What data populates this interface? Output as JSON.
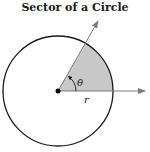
{
  "title": "Sector of a Circle",
  "diagram": {
    "angle_label": "θ",
    "radius_label": "r",
    "colors": {
      "sector_fill": "#c8c8c8",
      "circle_stroke": "#1a1a1a",
      "ray_stroke": "#7a7a7a",
      "center_dot": "#000000"
    }
  }
}
